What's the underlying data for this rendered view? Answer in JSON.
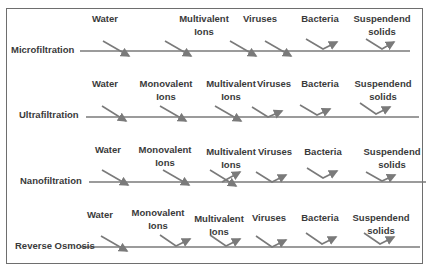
{
  "processes": [
    {
      "name": "Microfiltration",
      "labels": [
        {
          "text": "Water",
          "sub": ""
        },
        {
          "text": "Multivalent",
          "sub": "Ions"
        },
        {
          "text": "Viruses",
          "sub": ""
        },
        {
          "text": "Bacteria",
          "sub": ""
        },
        {
          "text": "Suspendend",
          "sub": "solids"
        }
      ],
      "passes": [
        "Water",
        "Monovalent Ions",
        "Multivalent Ions",
        "Viruses"
      ],
      "rejects": [
        "Bacteria",
        "Suspendend solids"
      ]
    },
    {
      "name": "Ultrafiltration",
      "labels": [
        {
          "text": "Water",
          "sub": ""
        },
        {
          "text": "Monovalent",
          "sub": "Ions"
        },
        {
          "text": "Multivalent",
          "sub": "Ions"
        },
        {
          "text": "Viruses",
          "sub": ""
        },
        {
          "text": "Bacteria",
          "sub": ""
        },
        {
          "text": "Suspendend",
          "sub": "solids"
        }
      ],
      "passes": [
        "Water",
        "Monovalent Ions",
        "Multivalent Ions"
      ],
      "rejects": [
        "Viruses",
        "Bacteria",
        "Suspendend solids"
      ]
    },
    {
      "name": "Nanofiltration",
      "labels": [
        {
          "text": "Water",
          "sub": ""
        },
        {
          "text": "Monovalent",
          "sub": "Ions"
        },
        {
          "text": "Multivalent",
          "sub": "Ions"
        },
        {
          "text": "Viruses",
          "sub": ""
        },
        {
          "text": "Bacteria",
          "sub": ""
        },
        {
          "text": "Suspendend",
          "sub": "solids"
        }
      ],
      "passes": [
        "Water",
        "Monovalent Ions",
        "Multivalent Ions (partial)"
      ],
      "rejects": [
        "Multivalent Ions (partial)",
        "Viruses",
        "Bacteria",
        "Suspendend solids"
      ]
    },
    {
      "name": "Reverse Osmosis",
      "labels": [
        {
          "text": "Water",
          "sub": ""
        },
        {
          "text": "Monovalent",
          "sub": "Ions"
        },
        {
          "text": "Multivalent",
          "sub": "Ions"
        },
        {
          "text": "Viruses",
          "sub": ""
        },
        {
          "text": "Bacteria",
          "sub": ""
        },
        {
          "text": "Suspendend",
          "sub": "solids"
        }
      ],
      "passes": [
        "Water"
      ],
      "rejects": [
        "Monovalent Ions",
        "Multivalent Ions",
        "Viruses",
        "Bacteria",
        "Suspendend solids"
      ]
    }
  ],
  "colors": {
    "line": "#7a7a7a",
    "text": "#3a3a3a",
    "frame": "#6e6e6e"
  }
}
